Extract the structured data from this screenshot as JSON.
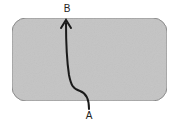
{
  "diagram": {
    "region": {
      "fill": "#c4c4c4",
      "stroke": "#8a8a8a"
    },
    "path": {
      "color": "#1a1a1a"
    },
    "labels": {
      "start": "A",
      "end": "B"
    }
  }
}
